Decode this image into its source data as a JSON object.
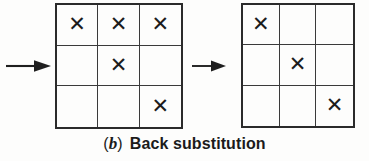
{
  "figure": {
    "caption_label_open": "(",
    "caption_label_letter": "b",
    "caption_label_close": ")",
    "caption_text": "Back substitution",
    "ink_color": "#1c1c1c",
    "border_color": "#2b2b2b",
    "grid_line_color": "#3a3a3a",
    "background_color": "#fdfdfc"
  },
  "arrows": [
    {
      "name": "arrow-into-left-matrix",
      "glyph": "right-arrow"
    },
    {
      "name": "arrow-between-matrices",
      "glyph": "right-arrow"
    }
  ],
  "matrices": [
    {
      "name": "upper-triangular-matrix",
      "mark": "✕",
      "rows": [
        [
          "✕",
          "✕",
          "✕"
        ],
        [
          "",
          "✕",
          ""
        ],
        [
          "",
          "",
          "✕"
        ]
      ]
    },
    {
      "name": "diagonal-matrix",
      "mark": "✕",
      "rows": [
        [
          "✕",
          "",
          ""
        ],
        [
          "",
          "✕",
          ""
        ],
        [
          "",
          "",
          "✕"
        ]
      ]
    }
  ]
}
